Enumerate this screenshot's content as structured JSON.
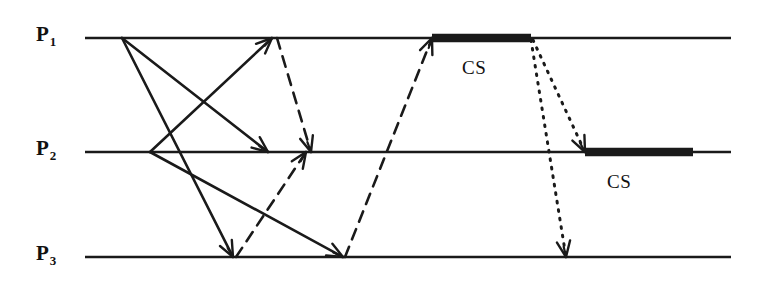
{
  "figure": {
    "type": "message-sequence-timeline-diagram",
    "background_color": "#ffffff",
    "ink_color": "#1a1a1a",
    "width": 776,
    "height": 289
  },
  "processes": [
    {
      "id": "P1",
      "name": "P",
      "subscript": "1",
      "label_x": 36,
      "label_y": 22,
      "line_y": 38,
      "line_x1": 85,
      "line_x2": 731
    },
    {
      "id": "P2",
      "name": "P",
      "subscript": "2",
      "label_x": 36,
      "label_y": 136,
      "line_y": 152,
      "line_x1": 85,
      "line_x2": 731
    },
    {
      "id": "P3",
      "name": "P",
      "subscript": "3",
      "label_x": 36,
      "label_y": 241,
      "line_y": 257,
      "line_x1": 85,
      "line_x2": 731
    }
  ],
  "critical_sections": [
    {
      "label": "CS",
      "process": "P1",
      "bar_x1": 432,
      "bar_x2": 531,
      "bar_y": 38,
      "label_x": 462,
      "label_y": 57
    },
    {
      "label": "CS",
      "process": "P2",
      "bar_x1": 585,
      "bar_x2": 693,
      "bar_y": 152,
      "label_x": 607,
      "label_y": 171
    }
  ],
  "messages": [
    {
      "style": "solid",
      "from": "P1",
      "to": "P2",
      "x1": 122,
      "y1": 38,
      "x2": 268,
      "y2": 152
    },
    {
      "style": "solid",
      "from": "P1",
      "to": "P3",
      "x1": 122,
      "y1": 38,
      "x2": 233,
      "y2": 257
    },
    {
      "style": "solid",
      "from": "P2",
      "to": "P1",
      "x1": 150,
      "y1": 152,
      "x2": 272,
      "y2": 38
    },
    {
      "style": "solid",
      "from": "P2",
      "to": "P3",
      "x1": 150,
      "y1": 152,
      "x2": 343,
      "y2": 257
    },
    {
      "style": "dashed",
      "from": "P1",
      "to": "P2",
      "x1": 277,
      "y1": 38,
      "x2": 311,
      "y2": 152
    },
    {
      "style": "dashed",
      "from": "P3",
      "to": "P2",
      "x1": 236,
      "y1": 257,
      "x2": 306,
      "y2": 152
    },
    {
      "style": "dashed",
      "from": "P3",
      "to": "P1",
      "x1": 345,
      "y1": 257,
      "x2": 432,
      "y2": 38
    },
    {
      "style": "dotted",
      "from": "P1",
      "to": "P2",
      "x1": 533,
      "y1": 40,
      "x2": 585,
      "y2": 152
    },
    {
      "style": "dotted",
      "from": "P1",
      "to": "P3",
      "x1": 531,
      "y1": 40,
      "x2": 566,
      "y2": 257
    }
  ]
}
